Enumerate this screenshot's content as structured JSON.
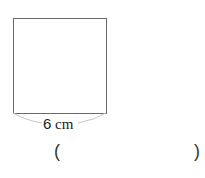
{
  "figure": {
    "shape": "square",
    "side_label": {
      "value": "6",
      "unit": "cm"
    }
  },
  "answer_blank": {
    "open": "(",
    "close": ")"
  },
  "colors": {
    "outline": "#6a6a6a",
    "brace": "#c8c8c8",
    "text": "#222222"
  }
}
